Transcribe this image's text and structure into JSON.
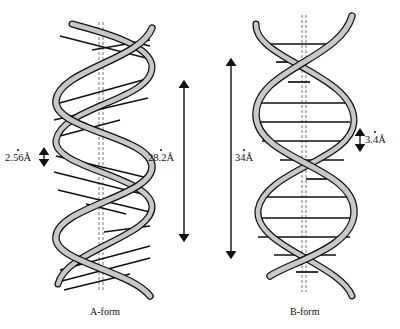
{
  "figure": {
    "colors": {
      "strand_fill": "#c8c8c8",
      "strand_outline": "#111111",
      "base_pair": "#111111",
      "axis": "#777777",
      "background": "#ffffff"
    },
    "a_form": {
      "caption": "A-form",
      "rise_label": "2.56Å",
      "pitch_label": "28.2Å",
      "base_pairs_visible": 16
    },
    "b_form": {
      "caption": "B-form",
      "rise_label": "3.4Å",
      "pitch_label": "34Å",
      "base_pairs_visible": 13
    }
  }
}
